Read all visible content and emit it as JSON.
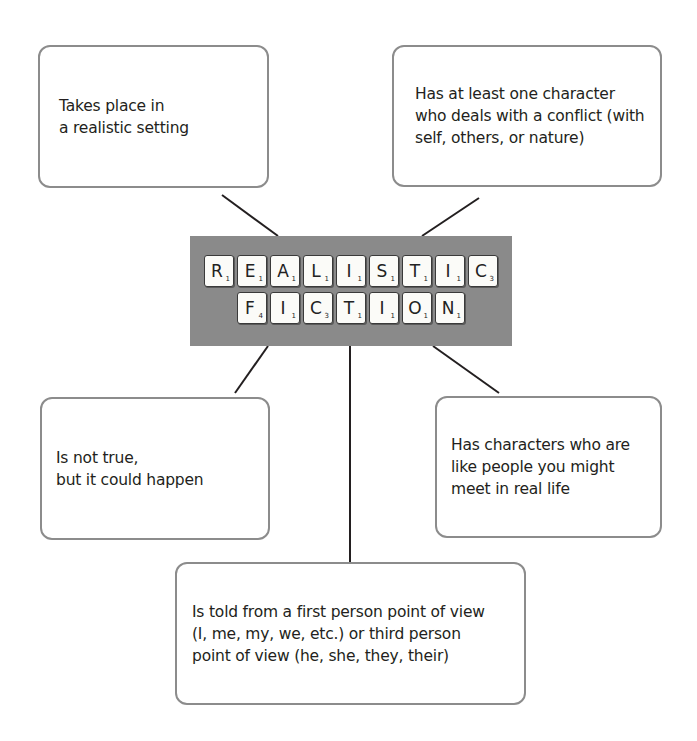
{
  "title": {
    "row1": [
      {
        "letter": "R",
        "score": "1"
      },
      {
        "letter": "E",
        "score": "1"
      },
      {
        "letter": "A",
        "score": "1"
      },
      {
        "letter": "L",
        "score": "1"
      },
      {
        "letter": "I",
        "score": "1"
      },
      {
        "letter": "S",
        "score": "1"
      },
      {
        "letter": "T",
        "score": "1"
      },
      {
        "letter": "I",
        "score": "1"
      },
      {
        "letter": "C",
        "score": "3"
      }
    ],
    "row2": [
      {
        "letter": "F",
        "score": "4"
      },
      {
        "letter": "I",
        "score": "1"
      },
      {
        "letter": "C",
        "score": "3"
      },
      {
        "letter": "T",
        "score": "1"
      },
      {
        "letter": "I",
        "score": "1"
      },
      {
        "letter": "O",
        "score": "1"
      },
      {
        "letter": "N",
        "score": "1"
      }
    ],
    "banner_color": "#8a8a8a"
  },
  "nodes": {
    "top_left": "Takes place in\na realistic setting",
    "top_right": "Has at least one character\nwho deals with a conflict (with\nself, others, or nature)",
    "bottom_left": "Is not true,\nbut it could happen",
    "bottom_right": "Has characters who are\nlike people you might\nmeet in real life",
    "bottom": "Is told from a first person point of view\n(I, me, my, we, etc.) or third person\npoint of view (he, she, they, their)"
  },
  "colors": {
    "box_border": "#8c8c8c",
    "connector": "#231f20",
    "text": "#231f20"
  }
}
